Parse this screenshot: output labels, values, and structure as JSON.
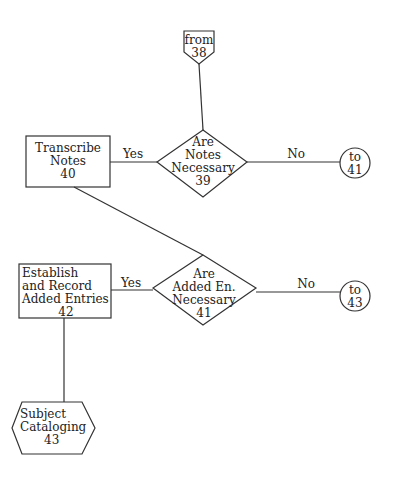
{
  "flowchart": {
    "connector_from": {
      "line1": "from",
      "line2": "38"
    },
    "decision_39": {
      "line1": "Are",
      "line2": "Notes",
      "line3": "Necessary",
      "number": "39"
    },
    "process_40": {
      "line1": "Transcribe",
      "line2": "Notes",
      "number": "40"
    },
    "edge_39_yes": "Yes",
    "edge_39_no": "No",
    "connector_to_41": {
      "line1": "to",
      "line2": "41"
    },
    "decision_41": {
      "line1": "Are",
      "line2": "Added En.",
      "line3": "Necessary",
      "number": "41"
    },
    "process_42": {
      "line1": "Establish",
      "line2": "and Record",
      "line3": "Added Entries",
      "number": "42"
    },
    "edge_41_yes": "Yes",
    "edge_41_no": "No",
    "connector_to_43": {
      "line1": "to",
      "line2": "43"
    },
    "subprocess_43": {
      "line1": "Subject",
      "line2": "Cataloging",
      "number": "43"
    }
  },
  "colors": {
    "line": "#333333",
    "background": "#ffffff"
  }
}
